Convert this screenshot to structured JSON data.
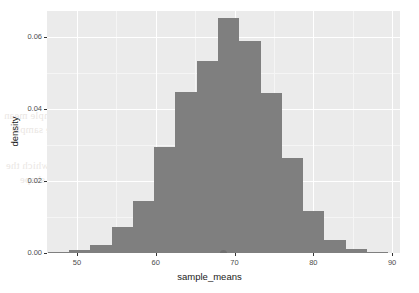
{
  "figure": {
    "name": "density-histogram",
    "panel_background": "#ebebeb",
    "grid_color": "#ffffff",
    "bar_fill": "#7f7f7f",
    "page_background": "#ffffff"
  },
  "chart_data": {
    "type": "bar",
    "title": "",
    "subtitle": "",
    "xlabel": "sample_means",
    "ylabel": "density",
    "xlim": [
      46.2,
      91.0
    ],
    "ylim": [
      0.0,
      0.0672
    ],
    "grid": true,
    "legend": null,
    "xticks": [
      50,
      60,
      70,
      80,
      90
    ],
    "xtick_labels": [
      "50",
      "60",
      "70",
      "80",
      "90"
    ],
    "yticks": [
      0.0,
      0.02,
      0.04,
      0.06
    ],
    "ytick_labels": [
      "0.00",
      "0.02",
      "0.04",
      "0.06"
    ],
    "bin_width": 2.72,
    "bins": [
      {
        "left": 46.3,
        "right": 49.0,
        "center": 47.6,
        "value": 0.0004
      },
      {
        "left": 49.0,
        "right": 51.7,
        "center": 50.3,
        "value": 0.0009
      },
      {
        "left": 51.7,
        "right": 54.4,
        "center": 53.0,
        "value": 0.0022
      },
      {
        "left": 54.4,
        "right": 57.1,
        "center": 55.7,
        "value": 0.0071
      },
      {
        "left": 57.1,
        "right": 59.8,
        "center": 58.4,
        "value": 0.0145
      },
      {
        "left": 59.8,
        "right": 62.5,
        "center": 61.1,
        "value": 0.0295
      },
      {
        "left": 62.5,
        "right": 65.2,
        "center": 63.8,
        "value": 0.0448
      },
      {
        "left": 65.2,
        "right": 67.9,
        "center": 66.5,
        "value": 0.0532
      },
      {
        "left": 67.9,
        "right": 70.6,
        "center": 69.2,
        "value": 0.0652
      },
      {
        "left": 70.6,
        "right": 73.3,
        "center": 71.9,
        "value": 0.059
      },
      {
        "left": 73.3,
        "right": 76.0,
        "center": 74.6,
        "value": 0.0445
      },
      {
        "left": 76.0,
        "right": 78.7,
        "center": 77.3,
        "value": 0.0264
      },
      {
        "left": 78.7,
        "right": 81.4,
        "center": 80.0,
        "value": 0.0116
      },
      {
        "left": 81.4,
        "right": 84.1,
        "center": 82.7,
        "value": 0.0035
      },
      {
        "left": 84.1,
        "right": 86.8,
        "center": 85.4,
        "value": 0.001
      },
      {
        "left": 86.8,
        "right": 89.5,
        "center": 88.1,
        "value": 0.0004
      }
    ],
    "annotations": [
      {
        "name": "point-artifact",
        "x": 68.6,
        "y": 0.0
      }
    ]
  },
  "bleed_text": {
    "lines": [
      "the sampling distribution of the sample mean",
      "approaches a normal distribution as the sample",
      "size becomes large",
      "drawn from the population from which the",
      "samples are taken regardless of the shape"
    ]
  }
}
